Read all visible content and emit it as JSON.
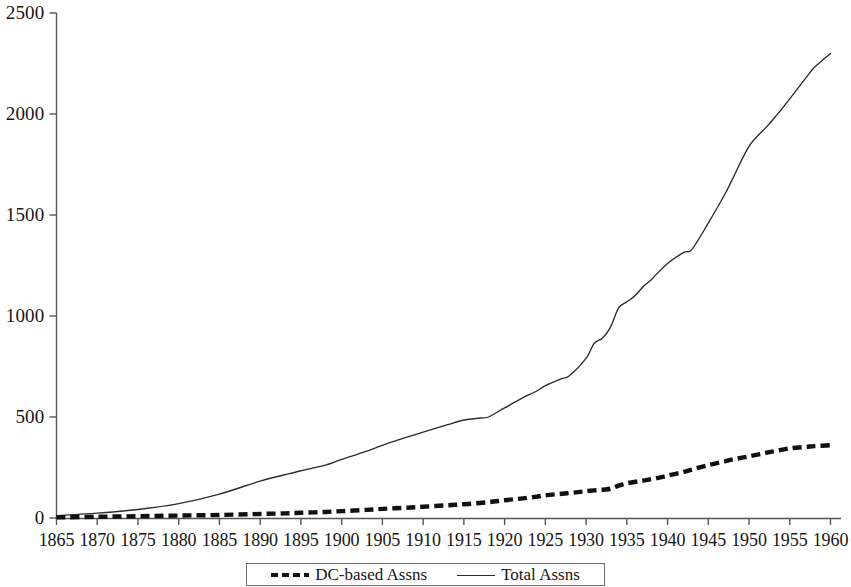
{
  "chart_data": {
    "type": "line",
    "title": "",
    "subtitle": "",
    "xlabel": "",
    "ylabel": "",
    "xlim": [
      1865,
      1960
    ],
    "ylim": [
      0,
      2500
    ],
    "grid": false,
    "legend_position": "bottom",
    "x_ticks": [
      1865,
      1870,
      1875,
      1880,
      1885,
      1890,
      1895,
      1900,
      1905,
      1910,
      1915,
      1920,
      1925,
      1930,
      1935,
      1940,
      1945,
      1950,
      1955,
      1960
    ],
    "y_ticks": [
      0,
      500,
      1000,
      1500,
      2000,
      2500
    ],
    "x": [
      1865,
      1866,
      1867,
      1868,
      1869,
      1870,
      1871,
      1872,
      1873,
      1874,
      1875,
      1876,
      1877,
      1878,
      1879,
      1880,
      1881,
      1882,
      1883,
      1884,
      1885,
      1886,
      1887,
      1888,
      1889,
      1890,
      1891,
      1892,
      1893,
      1894,
      1895,
      1896,
      1897,
      1898,
      1899,
      1900,
      1901,
      1902,
      1903,
      1904,
      1905,
      1906,
      1907,
      1908,
      1909,
      1910,
      1911,
      1912,
      1913,
      1914,
      1915,
      1916,
      1917,
      1918,
      1919,
      1920,
      1921,
      1922,
      1923,
      1924,
      1925,
      1926,
      1927,
      1928,
      1929,
      1930,
      1931,
      1932,
      1933,
      1934,
      1935,
      1936,
      1937,
      1938,
      1939,
      1940,
      1941,
      1942,
      1943,
      1944,
      1945,
      1946,
      1947,
      1948,
      1949,
      1950,
      1951,
      1952,
      1953,
      1954,
      1955,
      1956,
      1957,
      1958,
      1959,
      1960
    ],
    "series": [
      {
        "name": "Total Assns",
        "style": "solid",
        "color": "#2b2b2b",
        "width": 1.3,
        "values": [
          12,
          14,
          16,
          18,
          21,
          24,
          27,
          30,
          34,
          38,
          42,
          47,
          52,
          58,
          64,
          71,
          79,
          88,
          97,
          107,
          118,
          130,
          142,
          155,
          169,
          183,
          197,
          210,
          222,
          234,
          246,
          258,
          271,
          285,
          300,
          316,
          333,
          351,
          370,
          390,
          411,
          433,
          456,
          480,
          505,
          531,
          558,
          586,
          615,
          645,
          676,
          708,
          741,
          775,
          810,
          846,
          878,
          906,
          933,
          960,
          990,
          1025,
          1064,
          1108,
          1156,
          1207,
          1263,
          1330,
          1430,
          1520,
          1590,
          1655,
          1718,
          1780,
          1843,
          1905,
          1968,
          2030,
          2093,
          2150,
          2200,
          2248,
          2293,
          2335,
          2375,
          2412,
          2447,
          2480,
          2512,
          2544,
          2575,
          2605,
          2635,
          2665,
          2695,
          2725
        ]
      },
      {
        "name": "DC-based Assns",
        "style": "dashed",
        "color": "#111111",
        "width": 4,
        "values": [
          3,
          3,
          4,
          4,
          5,
          5,
          6,
          6,
          7,
          7,
          8,
          8,
          9,
          9,
          10,
          11,
          11,
          12,
          13,
          13,
          14,
          15,
          16,
          17,
          18,
          19,
          20,
          21,
          22,
          23,
          24,
          25,
          26,
          28,
          30,
          32,
          34,
          36,
          38,
          40,
          42,
          45,
          47,
          49,
          51,
          54,
          57,
          60,
          63,
          66,
          69,
          72,
          76,
          80,
          84,
          89,
          94,
          99,
          104,
          109,
          114,
          119,
          124,
          129,
          134,
          139,
          143,
          146,
          150,
          162,
          172,
          180,
          188,
          196,
          205,
          214,
          224,
          234,
          244,
          254,
          264,
          273,
          281,
          289,
          297,
          305,
          313,
          321,
          329,
          337,
          345,
          350,
          354,
          357,
          360,
          363
        ]
      }
    ],
    "series_note": "Total Assns values after 1935 are rendered against the plotted curve; see rendered path.",
    "total_assns_plot": [
      [
        1865,
        12
      ],
      [
        1870,
        24
      ],
      [
        1875,
        42
      ],
      [
        1880,
        71
      ],
      [
        1885,
        118
      ],
      [
        1890,
        183
      ],
      [
        1893,
        214
      ],
      [
        1895,
        234
      ],
      [
        1898,
        262
      ],
      [
        1900,
        290
      ],
      [
        1903,
        330
      ],
      [
        1905,
        360
      ],
      [
        1908,
        400
      ],
      [
        1910,
        425
      ],
      [
        1913,
        462
      ],
      [
        1915,
        485
      ],
      [
        1917,
        495
      ],
      [
        1918,
        500
      ],
      [
        1920,
        545
      ],
      [
        1922,
        590
      ],
      [
        1924,
        630
      ],
      [
        1925,
        655
      ],
      [
        1927,
        690
      ],
      [
        1928,
        705
      ],
      [
        1930,
        790
      ],
      [
        1931,
        865
      ],
      [
        1932,
        890
      ],
      [
        1933,
        945
      ],
      [
        1934,
        1040
      ],
      [
        1935,
        1070
      ],
      [
        1936,
        1100
      ],
      [
        1937,
        1145
      ],
      [
        1938,
        1180
      ],
      [
        1940,
        1260
      ],
      [
        1942,
        1315
      ],
      [
        1943,
        1330
      ],
      [
        1945,
        1460
      ],
      [
        1947,
        1600
      ],
      [
        1948,
        1680
      ],
      [
        1950,
        1840
      ],
      [
        1952,
        1930
      ],
      [
        1953,
        1975
      ],
      [
        1955,
        2075
      ],
      [
        1957,
        2180
      ],
      [
        1958,
        2230
      ],
      [
        1960,
        2300
      ]
    ],
    "dc_assns_plot": [
      [
        1865,
        3
      ],
      [
        1870,
        6
      ],
      [
        1875,
        9
      ],
      [
        1880,
        12
      ],
      [
        1885,
        15
      ],
      [
        1890,
        20
      ],
      [
        1893,
        23
      ],
      [
        1895,
        26
      ],
      [
        1898,
        30
      ],
      [
        1900,
        34
      ],
      [
        1903,
        40
      ],
      [
        1905,
        45
      ],
      [
        1908,
        51
      ],
      [
        1910,
        56
      ],
      [
        1913,
        63
      ],
      [
        1915,
        68
      ],
      [
        1918,
        78
      ],
      [
        1920,
        88
      ],
      [
        1922,
        96
      ],
      [
        1924,
        106
      ],
      [
        1925,
        112
      ],
      [
        1927,
        120
      ],
      [
        1929,
        128
      ],
      [
        1930,
        133
      ],
      [
        1932,
        140
      ],
      [
        1933,
        145
      ],
      [
        1934,
        160
      ],
      [
        1935,
        172
      ],
      [
        1937,
        185
      ],
      [
        1939,
        200
      ],
      [
        1940,
        210
      ],
      [
        1942,
        228
      ],
      [
        1943,
        240
      ],
      [
        1945,
        262
      ],
      [
        1947,
        280
      ],
      [
        1948,
        290
      ],
      [
        1950,
        305
      ],
      [
        1952,
        322
      ],
      [
        1953,
        330
      ],
      [
        1955,
        345
      ],
      [
        1957,
        352
      ],
      [
        1958,
        356
      ],
      [
        1960,
        360
      ]
    ]
  },
  "axes": {
    "y_tick_labels": [
      "2500",
      "2000",
      "1500",
      "1000",
      "500",
      "0"
    ],
    "x_tick_labels": [
      "1865",
      "1870",
      "1875",
      "1880",
      "1885",
      "1890",
      "1895",
      "1900",
      "1905",
      "1910",
      "1915",
      "1920",
      "1925",
      "1930",
      "1935",
      "1940",
      "1945",
      "1950",
      "1955",
      "1960"
    ]
  },
  "legend": {
    "entries": [
      {
        "label": "DC-based Assns",
        "style": "dashed"
      },
      {
        "label": "Total Assns",
        "style": "solid"
      }
    ]
  },
  "colors": {
    "axis": "#555555",
    "total_line": "#2b2b2b",
    "dc_line": "#111111",
    "background": "#ffffff",
    "legend_border": "#6d6d6d"
  }
}
